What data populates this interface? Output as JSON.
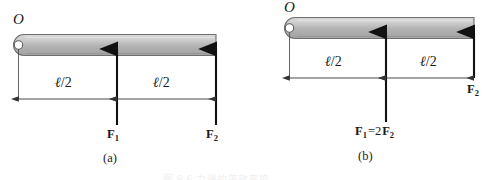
{
  "figure": {
    "width": 491,
    "height": 180,
    "background": "#ffffff",
    "bottom_caption": "图 9-6  力偶的等效变换"
  },
  "colors": {
    "rod_fill_light": "#d8d8d8",
    "rod_fill_mid": "#aeaeae",
    "rod_fill_dark": "#9a9a9a",
    "rod_outline": "#6e6e6e",
    "arrow": "#111111",
    "dimension_line": "#444444",
    "text": "#1a1a1a"
  },
  "panels": [
    {
      "id": "a",
      "caption": "(a)",
      "pivot_label": "O",
      "dimensions": [
        {
          "id": "left",
          "value_prefix": "ℓ",
          "value_suffix": "/2",
          "text": "ℓ/2"
        },
        {
          "id": "right",
          "value_prefix": "ℓ",
          "value_suffix": "/2",
          "text": "ℓ/2"
        }
      ],
      "forces": [
        {
          "id": "F1",
          "symbol": "F",
          "subscript": "1",
          "text": "F1",
          "relation": ""
        },
        {
          "id": "F2",
          "symbol": "F",
          "subscript": "2",
          "text": "F2",
          "relation": ""
        }
      ]
    },
    {
      "id": "b",
      "caption": "(b)",
      "pivot_label": "O",
      "dimensions": [
        {
          "id": "left",
          "value_prefix": "ℓ",
          "value_suffix": "/2",
          "text": "ℓ/2"
        },
        {
          "id": "right",
          "value_prefix": "ℓ",
          "value_suffix": "/2",
          "text": "ℓ/2"
        }
      ],
      "forces": [
        {
          "id": "F1",
          "symbol": "F",
          "subscript": "1",
          "text": "F1=2F2",
          "relation": "=2"
        },
        {
          "id": "F2",
          "symbol": "F",
          "subscript": "2",
          "text": "F2",
          "relation": ""
        }
      ]
    }
  ]
}
